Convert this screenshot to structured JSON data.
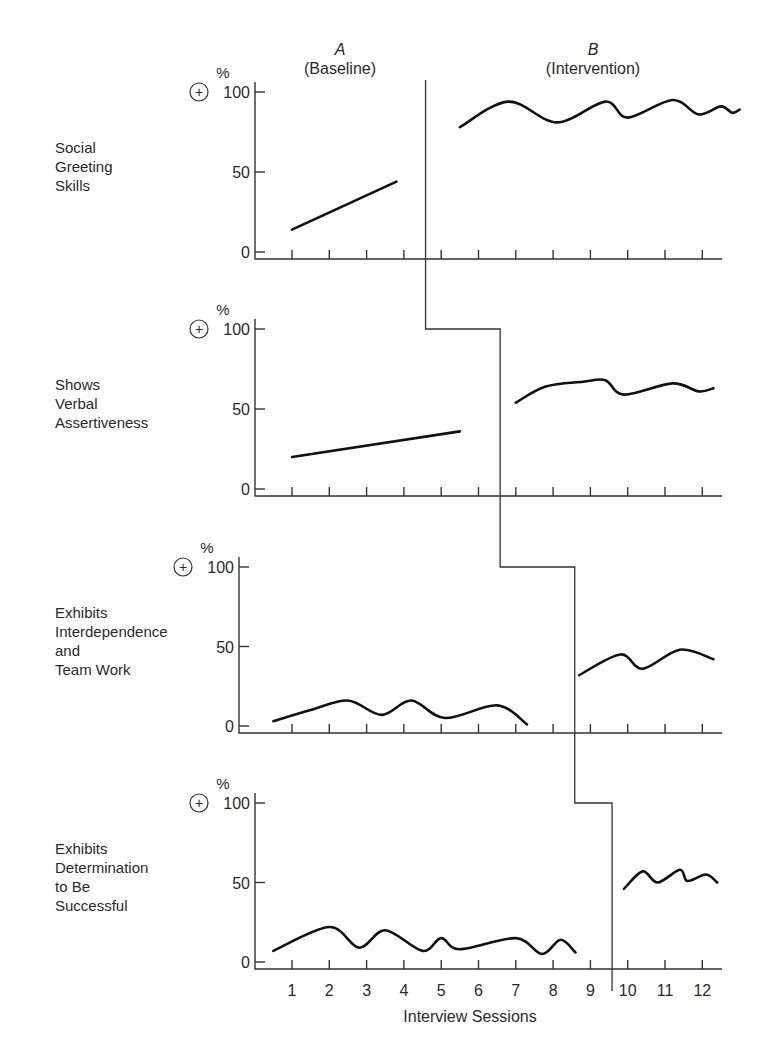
{
  "chart_data": {
    "type": "line",
    "xlabel": "Interview Sessions",
    "ylabel": "%",
    "x_ticks": [
      "1",
      "2",
      "3",
      "4",
      "5",
      "6",
      "7",
      "8",
      "9",
      "10",
      "11",
      "12"
    ],
    "y_ticks": [
      "0",
      "50",
      "100"
    ],
    "ylim": [
      0,
      100
    ],
    "phases": [
      {
        "letter": "A",
        "name": "(Baseline)"
      },
      {
        "letter": "B",
        "name": "(Intervention)"
      }
    ],
    "y_marker_symbol": "+",
    "panels": [
      {
        "label_lines": [
          "Social",
          "Greeting",
          "Skills"
        ],
        "phase_change_after_session": 4.5,
        "series": [
          {
            "name": "Baseline",
            "x": [
              1,
              3.8
            ],
            "y": [
              14,
              44
            ]
          },
          {
            "name": "Intervention",
            "x": [
              5.5,
              6.8,
              8.1,
              9.4,
              10.0,
              11.2,
              11.9,
              12.5,
              12.8,
              13.0
            ],
            "y": [
              78,
              94,
              81,
              94,
              84,
              95,
              86,
              91,
              87,
              89
            ]
          }
        ]
      },
      {
        "label_lines": [
          "Shows",
          "Verbal",
          "Assertiveness"
        ],
        "phase_change_after_session": 6.5,
        "series": [
          {
            "name": "Baseline",
            "x": [
              1,
              5.5
            ],
            "y": [
              20,
              36
            ]
          },
          {
            "name": "Intervention",
            "x": [
              7.0,
              7.8,
              8.8,
              9.4,
              9.9,
              11.2,
              11.9,
              12.3
            ],
            "y": [
              54,
              64,
              67,
              68,
              59,
              66,
              61,
              63
            ]
          }
        ]
      },
      {
        "label_lines": [
          "Exhibits",
          "Interdependence",
          "and",
          "Team Work"
        ],
        "phase_change_after_session": 8.5,
        "series": [
          {
            "name": "Baseline",
            "x": [
              0.5,
              1.5,
              2.5,
              3.4,
              4.2,
              5.1,
              6.5,
              7.3
            ],
            "y": [
              3,
              10,
              16,
              7,
              16,
              5,
              13,
              1
            ]
          },
          {
            "name": "Intervention",
            "x": [
              8.7,
              9.8,
              10.4,
              11.4,
              12.3
            ],
            "y": [
              32,
              45,
              36,
              48,
              42
            ]
          }
        ]
      },
      {
        "label_lines": [
          "Exhibits",
          "Determination",
          "to Be",
          "Successful"
        ],
        "phase_change_after_session": 9.5,
        "series": [
          {
            "name": "Baseline",
            "x": [
              0.5,
              2.0,
              2.8,
              3.5,
              4.5,
              5.0,
              5.5,
              7.0,
              7.7,
              8.2,
              8.6
            ],
            "y": [
              7,
              22,
              9,
              20,
              7,
              15,
              8,
              15,
              5,
              14,
              6
            ]
          },
          {
            "name": "Intervention",
            "x": [
              9.9,
              10.4,
              10.8,
              11.4,
              11.6,
              12.1,
              12.4
            ],
            "y": [
              46,
              57,
              50,
              58,
              51,
              55,
              50
            ]
          }
        ]
      }
    ]
  }
}
